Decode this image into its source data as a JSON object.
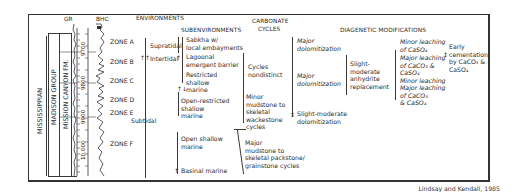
{
  "figure": {
    "credit": "Lindsay and Kendall, 1985",
    "stratigraphy": {
      "system": "MISSISSIPPIAN",
      "group": "MADISON GROUP",
      "formation": "MISSION CANYON FM."
    },
    "logs": {
      "gr_label": "GR",
      "bhc_label": "BHC",
      "depths": [
        "9700",
        "9800",
        "9900",
        "10,000"
      ]
    },
    "zones": [
      "ZONE A",
      "ZONE B",
      "ZONE C",
      "ZONE D",
      "ZONE E",
      "ZONE F"
    ],
    "headers": {
      "environments": "ENVIRONMENTS",
      "subenvironments": "SUBENVIRONMENTS",
      "carbonate_cycles_1": "CARBONATE",
      "carbonate_cycles_2": "CYCLES",
      "diagenetic": "DIAGENETIC MODIFICATIONS"
    },
    "environments": [
      "Supratidal",
      "Intertidal",
      "Subtidal"
    ],
    "subenvironments": [
      [
        "Sabkha w/",
        "local embayments"
      ],
      [
        "Lagoonal",
        "emergent barrier"
      ],
      [
        "Restricted",
        "shallow",
        "marine"
      ],
      [
        "Open-restricted",
        "shallow",
        "marine"
      ],
      [
        "Open shallow",
        "marine"
      ],
      [
        "Basinal marine"
      ]
    ],
    "carbonate_cycles": [
      [
        "Cycles",
        "nondistinct"
      ],
      [
        "Minor",
        "mudstone to",
        "skeletal",
        "wackestone",
        "cycles"
      ],
      [
        "Major",
        "mudstone to",
        "skeletal packstone/",
        "grainstone cycles"
      ]
    ],
    "dolomitization": [
      [
        "Major",
        "dolomitization"
      ],
      [
        "Major",
        "dolomitization"
      ],
      [
        "Slight-moderate",
        "dolomitization"
      ]
    ],
    "anhydrite": [
      "Slight-",
      "moderate",
      "anhydrite",
      "replacement"
    ],
    "leaching": [
      [
        "Minor leaching",
        "of CaSO₄"
      ],
      [
        "Major leaching",
        "of CaCO₃ &",
        "CaSO₄"
      ],
      [
        "Minor leaching"
      ],
      [
        "Major leaching",
        "of CaCO₃",
        "& CaSO₄"
      ]
    ],
    "cementation": [
      "Early",
      "cementation",
      "by CaCO₃ &",
      "CaSO₄"
    ]
  }
}
